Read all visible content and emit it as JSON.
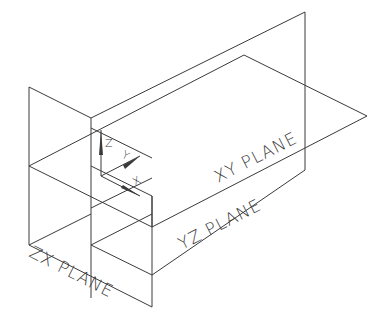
{
  "diagram": {
    "planes": [
      {
        "id": "xy",
        "label": "XY PLANE"
      },
      {
        "id": "yz",
        "label": "YZ PLANE"
      },
      {
        "id": "zx",
        "label": "ZX PLANE"
      }
    ],
    "axes": [
      {
        "id": "z",
        "label": "Z"
      },
      {
        "id": "y",
        "label": "Y"
      },
      {
        "id": "x",
        "label": "X"
      }
    ],
    "line_color": "#3a3a3a",
    "background": "#ffffff"
  }
}
